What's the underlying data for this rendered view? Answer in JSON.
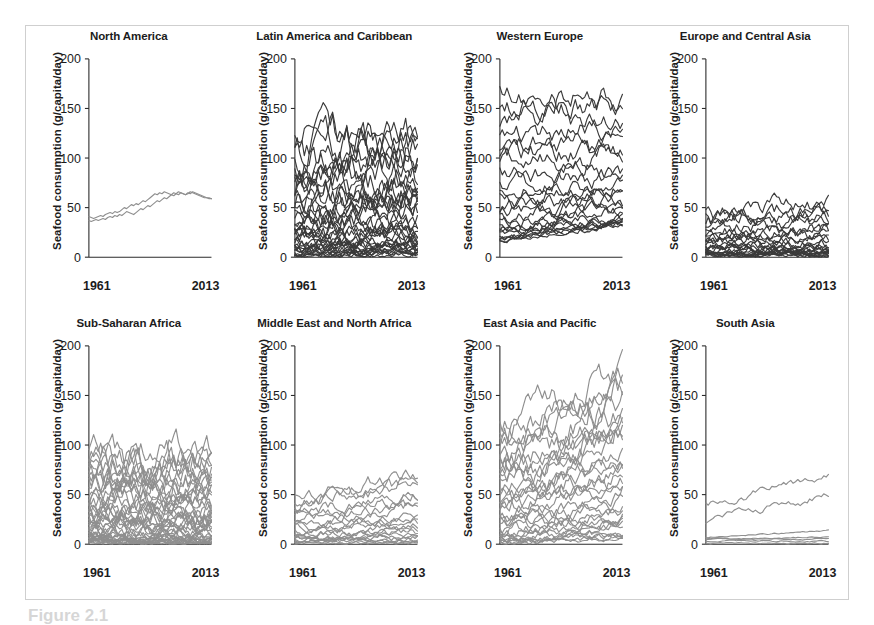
{
  "figure": {
    "caption": "Figure 2.1",
    "y_axis_title": "Seafood consumption (g/capita/day)",
    "x_start_label": "1961",
    "x_end_label": "2013",
    "y_ticks": [
      "0",
      "50",
      "100",
      "150",
      "200"
    ],
    "top_row_line_color": "#3a3a3a",
    "bottom_row_line_color": "#8f8f8f",
    "frame_color": "#cfcfcf",
    "axis_color": "#2b2b2b"
  },
  "chart_data": {
    "type": "line",
    "xlabel": "",
    "ylabel": "Seafood consumption (g/capita/day)",
    "xlim": [
      1961,
      2013
    ],
    "ylim": [
      0,
      200
    ],
    "y_ticks": [
      0,
      50,
      100,
      150,
      200
    ],
    "x_ticks": [
      1961,
      2013
    ],
    "grid": false,
    "legend": "none",
    "panel_layout": {
      "rows": 2,
      "cols": 4
    },
    "panels": [
      {
        "title": "North America",
        "row": 0,
        "col": 0,
        "line_color": "#8f8f8f",
        "n_series_approx": 2,
        "note": "Two countries rising from about 38 to about 60 g/capita/day",
        "series": [
          {
            "name": "series-1",
            "values": [
              41,
              40,
              39,
              40,
              41,
              42,
              41,
              43,
              44,
              45,
              44,
              46,
              45,
              46,
              48,
              50,
              49,
              51,
              53,
              52,
              54,
              53,
              55,
              57,
              56,
              58,
              60,
              62,
              64,
              63,
              65,
              64,
              66,
              65,
              64,
              63,
              65,
              64,
              66,
              65,
              64,
              63,
              64,
              66,
              65,
              64,
              63,
              62,
              61,
              60,
              60,
              59,
              59
            ]
          },
          {
            "name": "series-2",
            "values": [
              37,
              36,
              37,
              38,
              37,
              38,
              39,
              38,
              40,
              41,
              40,
              42,
              41,
              43,
              42,
              44,
              46,
              45,
              44,
              43,
              45,
              47,
              49,
              48,
              50,
              52,
              51,
              53,
              55,
              57,
              56,
              58,
              60,
              59,
              61,
              63,
              62,
              64,
              63,
              65,
              64,
              63,
              65,
              64,
              66,
              65,
              64,
              63,
              62,
              61,
              60,
              60,
              59
            ]
          }
        ]
      },
      {
        "title": "Latin America and Caribbean",
        "row": 0,
        "col": 1,
        "line_color": "#3a3a3a",
        "n_series_approx": 38,
        "note": "Dense bundle, max near 160, most below 100, many near 0",
        "range": [
          0,
          162
        ]
      },
      {
        "title": "Western Europe",
        "row": 0,
        "col": 2,
        "line_color": "#3a3a3a",
        "n_series_approx": 24,
        "note": "One series spikes near 195 early; general upward drift from 20-80 to 40-150",
        "range": [
          12,
          196
        ]
      },
      {
        "title": "Europe and Central Asia",
        "row": 0,
        "col": 3,
        "line_color": "#3a3a3a",
        "n_series_approx": 25,
        "note": "Top series peaks near 84 around 1990 then drops; most series under 30",
        "range": [
          0,
          85
        ]
      },
      {
        "title": "Sub-Saharan Africa",
        "row": 1,
        "col": 0,
        "line_color": "#8f8f8f",
        "n_series_approx": 45,
        "note": "Dense gray bundle, peak near 138, bulk between 0 and 80",
        "range": [
          0,
          140
        ]
      },
      {
        "title": "Middle East and North Africa",
        "row": 1,
        "col": 1,
        "line_color": "#8f8f8f",
        "n_series_approx": 20,
        "note": "Mostly below 50 early, top series rises to about 80 by 2013",
        "range": [
          0,
          82
        ]
      },
      {
        "title": "East Asia and Pacific",
        "row": 1,
        "col": 2,
        "line_color": "#8f8f8f",
        "n_series_approx": 32,
        "note": "Strong upward fan; top series near 195, many cross 100 after 1990",
        "range": [
          0,
          197
        ]
      },
      {
        "title": "South Asia",
        "row": 1,
        "col": 3,
        "line_color": "#8f8f8f",
        "n_series_approx": 7,
        "note": "Two series between 20 and 70; remainder flat near 0-15",
        "range": [
          0,
          72
        ]
      }
    ]
  }
}
